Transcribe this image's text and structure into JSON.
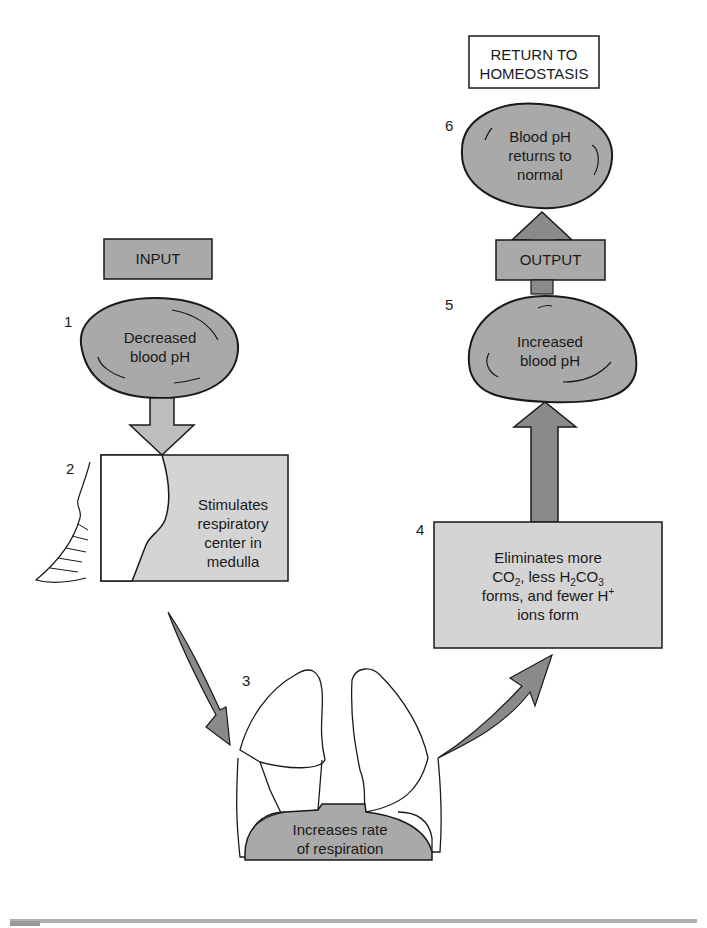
{
  "colors": {
    "box_fill": "#d4d4d4",
    "blob_fill": "#a9a9a9",
    "arrow_light": "#bdbdbd",
    "arrow_dark": "#8a8a8a",
    "stroke": "#1a1a1a",
    "bottom_bar": "#b0b0b0"
  },
  "labels": {
    "return_to_homeostasis_line1": "RETURN TO",
    "return_to_homeostasis_line2": "HOMEOSTASIS",
    "input": "INPUT",
    "output": "OUTPUT"
  },
  "steps": [
    {
      "number": "1",
      "lines": [
        "Decreased",
        "blood pH"
      ]
    },
    {
      "number": "2",
      "lines": [
        "Stimulates",
        "respiratory",
        "center in",
        "medulla"
      ]
    },
    {
      "number": "3",
      "lines": [
        "Increases rate",
        "of respiration"
      ]
    },
    {
      "number": "4",
      "lines": [
        "Eliminates more",
        "CO",
        "2",
        ", less H",
        "2",
        "CO",
        "3",
        "forms, and fewer H",
        "+",
        "ions form"
      ]
    },
    {
      "number": "5",
      "lines": [
        "Increased",
        "blood pH"
      ]
    },
    {
      "number": "6",
      "lines": [
        "Blood pH",
        "returns to",
        "normal"
      ]
    }
  ]
}
